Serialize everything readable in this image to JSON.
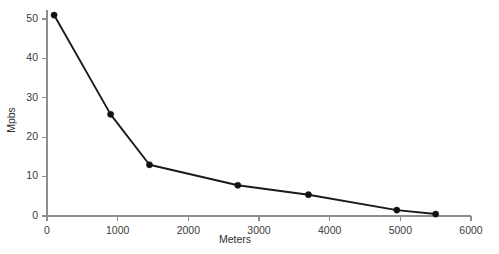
{
  "chart_data": {
    "type": "line",
    "title": "",
    "subtitle": "",
    "xlabel": "Meters",
    "ylabel": "Mpbs",
    "xlim": [
      0,
      6000
    ],
    "ylim": [
      0,
      55
    ],
    "xticks": [
      0,
      1000,
      2000,
      3000,
      4000,
      5000,
      6000
    ],
    "xtick_labels": [
      "0",
      "1000",
      "2000",
      "3000",
      "4000",
      "5000",
      "6000"
    ],
    "yticks": [
      0,
      10,
      20,
      30,
      40,
      50
    ],
    "ytick_labels": [
      "0",
      "10",
      "20",
      "30",
      "40",
      "50"
    ],
    "grid": false,
    "legend": false,
    "legend_position": "none",
    "marker": "filled-circle",
    "line_color": "#1a1a1a",
    "marker_color": "#111111",
    "axis_color": "#8d8d8d",
    "series": [
      {
        "name": "Throughput",
        "x": [
          100,
          900,
          1450,
          2700,
          3700,
          4950,
          5500
        ],
        "y": [
          51,
          25.8,
          13,
          7.8,
          5.4,
          1.5,
          0.5
        ]
      }
    ]
  }
}
